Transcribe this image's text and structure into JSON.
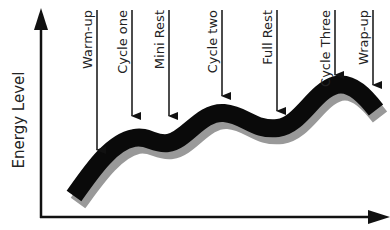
{
  "diagram": {
    "y_axis_label": "Energy Level",
    "x_axis_label": "",
    "colors": {
      "axis": "#111111",
      "wave": "#0a0a0a",
      "wave_shadow": "#999999",
      "text": "#222222",
      "background": "#ffffff"
    },
    "markers": [
      {
        "label": "Warm-up",
        "x": 97,
        "label_top": 10,
        "line_top": 10,
        "arrow_tip": 158
      },
      {
        "label": "Cycle one",
        "x": 132,
        "label_top": 10,
        "line_top": 10,
        "arrow_tip": 124
      },
      {
        "label": "Mini Rest",
        "x": 169,
        "label_top": 10,
        "line_top": 10,
        "arrow_tip": 124
      },
      {
        "label": "Cycle two",
        "x": 222,
        "label_top": 10,
        "line_top": 10,
        "arrow_tip": 104
      },
      {
        "label": "Full Rest",
        "x": 277,
        "label_top": 10,
        "line_top": 10,
        "arrow_tip": 119
      },
      {
        "label": "Cycle Three",
        "x": 335,
        "label_top": 10,
        "line_top": 10,
        "arrow_tip": 83
      },
      {
        "label": "Wrap-up",
        "x": 373,
        "label_top": 10,
        "line_top": 10,
        "arrow_tip": 93
      }
    ]
  }
}
